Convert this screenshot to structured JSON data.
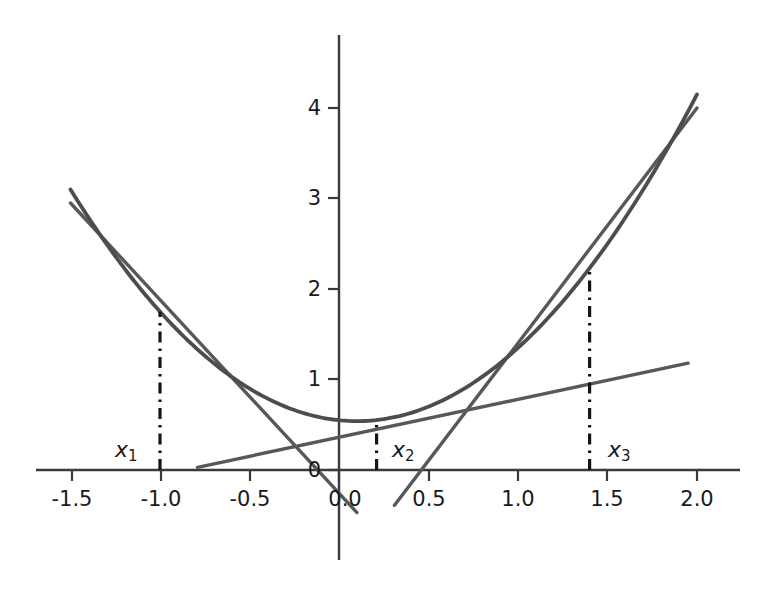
{
  "chart_data": {
    "type": "line",
    "title": "",
    "xlabel": "",
    "ylabel": "",
    "xlim": [
      -1.72,
      2.12
    ],
    "ylim": [
      -0.62,
      4.78
    ],
    "grid": false,
    "legend": null,
    "xticks": [
      -1.5,
      -1.0,
      -0.5,
      0.0,
      0.5,
      1.0,
      1.5,
      2.0
    ],
    "xticklabels": [
      "-1.5",
      "-1.0",
      "-0.5",
      "0.0",
      "0.5",
      "1.0",
      "1.5",
      "2.0"
    ],
    "yticks": [
      0,
      1,
      2,
      3,
      4
    ],
    "yticklabels": [
      "0",
      "1",
      "2",
      "3",
      "4"
    ],
    "series": [
      {
        "name": "f(x) = x^2 - 0.2x + 0.55",
        "type": "curve",
        "x_range": [
          -1.5,
          2.0
        ],
        "coeffs": {
          "a": 1.0,
          "b": -0.2,
          "c": 0.55
        },
        "points": [
          {
            "x": -1.5,
            "y": 3.1
          },
          {
            "x": -1.0,
            "y": 1.75
          },
          {
            "x": -0.5,
            "y": 0.9
          },
          {
            "x": 0.0,
            "y": 0.55
          },
          {
            "x": 0.1,
            "y": 0.54
          },
          {
            "x": 0.5,
            "y": 0.7
          },
          {
            "x": 1.0,
            "y": 1.35
          },
          {
            "x": 1.4,
            "y": 2.23
          },
          {
            "x": 2.0,
            "y": 4.15
          }
        ]
      },
      {
        "name": "tangent at x1",
        "type": "line",
        "tangent_at": -1.0,
        "slope": -2.2,
        "endpoints": [
          {
            "x": -1.5,
            "y": 2.95
          },
          {
            "x": 0.1,
            "y": -0.47
          }
        ]
      },
      {
        "name": "tangent at x2",
        "type": "line",
        "tangent_at": 0.21,
        "slope": 0.22,
        "endpoints": [
          {
            "x": -0.79,
            "y": 0.03
          },
          {
            "x": 1.95,
            "y": 1.18
          }
        ]
      },
      {
        "name": "tangent at x3",
        "type": "line",
        "tangent_at": 1.4,
        "slope": 2.6,
        "endpoints": [
          {
            "x": 0.31,
            "y": -0.39
          },
          {
            "x": 2.0,
            "y": 4.0
          }
        ]
      }
    ],
    "markers": [
      {
        "label": "x1",
        "label_text": "x",
        "label_sub": "1",
        "x": -1.0,
        "y_top": 1.75,
        "style": "dashdot-vertical"
      },
      {
        "label": "x2",
        "label_text": "x",
        "label_sub": "2",
        "x": 0.21,
        "y_top": 0.55,
        "style": "dashdot-vertical"
      },
      {
        "label": "x3",
        "label_text": "x",
        "label_sub": "3",
        "x": 1.4,
        "y_top": 2.23,
        "style": "dashdot-vertical"
      }
    ],
    "colors": {
      "curve": "#4d4d4d",
      "tangent": "#595959",
      "axis": "#3a3a3a",
      "text": "#1a1a1a",
      "background": "#ffffff"
    }
  },
  "axes": {
    "origin_label": "0",
    "x_axis_name": "x-axis",
    "y_axis_name": "y-axis"
  }
}
